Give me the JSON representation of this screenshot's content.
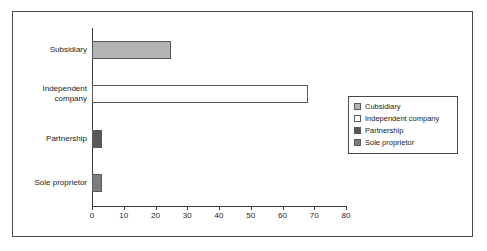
{
  "chart_data": {
    "type": "bar",
    "orientation": "horizontal",
    "title": "",
    "xlabel": "",
    "ylabel": "",
    "categories": [
      "Subsidiary",
      "Independent company",
      "Partnership",
      "Sole proprietor"
    ],
    "category_labels_display": [
      "Subsidiary",
      "Independent\ncompany",
      "Partnership",
      "Sole proprietor"
    ],
    "values": [
      25,
      68,
      3,
      3
    ],
    "xlim": [
      0,
      80
    ],
    "xticks": [
      0,
      10,
      20,
      30,
      40,
      50,
      60,
      70,
      80
    ],
    "xtick_labels": [
      "0",
      "10",
      "20",
      "30",
      "40",
      "50",
      "60",
      "70",
      "80"
    ],
    "grid": false,
    "legend_position": "right",
    "series": [
      {
        "name": "Cubsidiary",
        "value": 25,
        "color": "#b3b3b3"
      },
      {
        "name": "Independent company",
        "value": 68,
        "color": "#ffffff"
      },
      {
        "name": "Partnership",
        "value": 3,
        "color": "#595959"
      },
      {
        "name": "Sole proprietor",
        "value": 3,
        "color": "#7d7d7d"
      }
    ]
  },
  "legend": {
    "items": [
      {
        "label": "Cubsidiary",
        "color": "#b3b3b3"
      },
      {
        "label": "Independent company",
        "color": "#ffffff"
      },
      {
        "label": "Partnership",
        "color": "#595959"
      },
      {
        "label": "Sole proprietor",
        "color": "#7d7d7d"
      }
    ]
  },
  "colors": {
    "axis": "#3a3a3a",
    "border": "#4a4a4a",
    "text": "#1c1c1c",
    "background": "#ffffff"
  }
}
